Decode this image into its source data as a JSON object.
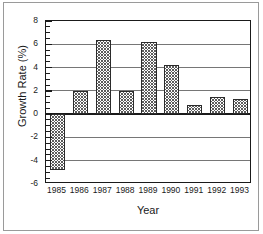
{
  "chart_data": {
    "type": "bar",
    "title": "",
    "xlabel": "Year",
    "ylabel": "Growth Rate (%)",
    "categories": [
      "1985",
      "1986",
      "1987",
      "1988",
      "1989",
      "1990",
      "1991",
      "1992",
      "1993"
    ],
    "values": [
      -4.8,
      2.0,
      6.4,
      2.0,
      6.2,
      4.2,
      0.8,
      1.5,
      1.3
    ],
    "ylim": [
      -6,
      8
    ],
    "ytick_values": [
      8,
      6,
      4,
      2,
      0,
      -2,
      -4,
      -6
    ],
    "ytick_labels": [
      "8",
      "6",
      "4",
      "2",
      "0",
      "-2",
      "-4",
      "-6"
    ],
    "yminor_step": 0.5,
    "grid": "horizontal-major",
    "legend": "none",
    "bar_fill": "crosshatch-gray",
    "bar_edge_color": "#2b2b2b",
    "axis_color": "#1a1a1a",
    "gridline_color": "#767676",
    "background_color": "#ffffff"
  }
}
